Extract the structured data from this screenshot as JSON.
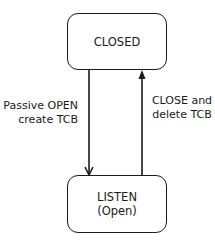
{
  "states": {
    "closed": {
      "label": "CLOSED"
    },
    "listen": {
      "line1": "LISTEN",
      "line2": "(Open)"
    }
  },
  "transitions": [
    {
      "from": "CLOSED",
      "to": "LISTEN",
      "line1": "Passive OPEN",
      "line2": "create TCB"
    },
    {
      "from": "LISTEN",
      "to": "CLOSED",
      "line1": "CLOSE and",
      "line2": "delete TCB"
    }
  ],
  "colors": {
    "stroke": "#1a1a1a",
    "background": "#ffffff"
  }
}
